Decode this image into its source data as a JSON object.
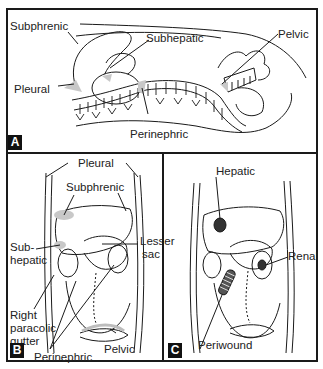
{
  "figure": {
    "panels": [
      {
        "id": "A",
        "badge": "A",
        "view": "lateral",
        "labels": {
          "subphrenic": "Subphrenic",
          "subhepatic": "Subhepatic",
          "pleural": "Pleural",
          "perinephric": "Perinephric",
          "pelvic": "Pelvic"
        }
      },
      {
        "id": "B",
        "badge": "B",
        "view": "frontal",
        "labels": {
          "pleural": "Pleural",
          "subphrenic": "Subphrenic",
          "lesser_sac_1": "Lesser",
          "lesser_sac_2": "sac",
          "subhepatic_1": "Sub-",
          "subhepatic_2": "hepatic",
          "right_paracolic_1": "Right",
          "right_paracolic_2": "paracolic",
          "right_paracolic_3": "gutter",
          "pelvic": "Pelvic",
          "perinephric": "Perinephric"
        }
      },
      {
        "id": "C",
        "badge": "C",
        "view": "frontal",
        "labels": {
          "hepatic": "Hepatic",
          "renal": "Renal",
          "periwound": "Periwound"
        }
      }
    ],
    "colors": {
      "line": "#1a1a1a",
      "fluid_shade": "#c8c8c8",
      "badge_bg": "#111111",
      "badge_text": "#ffffff"
    }
  }
}
